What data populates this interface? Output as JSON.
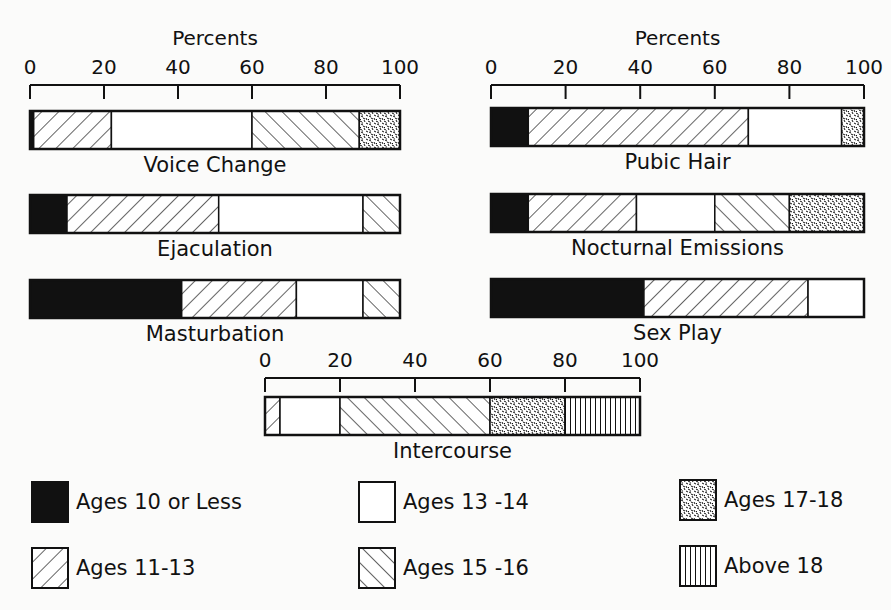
{
  "chart_data": {
    "type": "bar",
    "subtype": "stacked-horizontal-100-percent",
    "title": "",
    "xlabel": "Percents",
    "xlim": [
      0,
      100
    ],
    "x_ticks": [
      0,
      20,
      40,
      60,
      80,
      100
    ],
    "grid": false,
    "legend_position": "bottom",
    "series_names": [
      "Ages 10 or Less",
      "Ages 11-13",
      "Ages 13-14",
      "Ages 15-16",
      "Ages 17-18",
      "Above 18"
    ],
    "categories": [
      "Voice Change",
      "Ejaculation",
      "Masturbation",
      "Pubic Hair",
      "Nocturnal Emissions",
      "Sex Play",
      "Intercourse"
    ],
    "series": [
      {
        "name": "Ages 10 or Less",
        "pattern": "solid-black",
        "values": [
          1,
          10,
          41,
          10,
          10,
          41,
          0
        ]
      },
      {
        "name": "Ages 11-13",
        "pattern": "forward-hatch",
        "values": [
          21,
          41,
          31,
          59,
          29,
          44,
          4
        ]
      },
      {
        "name": "Ages 13-14",
        "pattern": "white",
        "values": [
          38,
          39,
          18,
          25,
          21,
          15,
          16
        ]
      },
      {
        "name": "Ages 15-16",
        "pattern": "back-hatch",
        "values": [
          29,
          10,
          10,
          0,
          20,
          0,
          40
        ]
      },
      {
        "name": "Ages 17-18",
        "pattern": "stipple",
        "values": [
          11,
          0,
          0,
          6,
          20,
          0,
          20
        ]
      },
      {
        "name": "Above 18",
        "pattern": "vertical-lines",
        "values": [
          0,
          0,
          0,
          0,
          0,
          0,
          20
        ]
      }
    ]
  },
  "panels": [
    {
      "axis_title": "Percents",
      "ticks": [
        "0",
        "20",
        "40",
        "60",
        "80",
        "100"
      ]
    },
    {
      "axis_title": "Percents",
      "ticks": [
        "0",
        "20",
        "40",
        "60",
        "80",
        "100"
      ]
    },
    {
      "axis_title": "",
      "ticks": [
        "0",
        "20",
        "40",
        "60",
        "80",
        "100"
      ]
    }
  ],
  "bars": [
    {
      "label": "Voice Change"
    },
    {
      "label": "Ejaculation"
    },
    {
      "label": "Masturbation"
    },
    {
      "label": "Pubic Hair"
    },
    {
      "label": "Nocturnal Emissions"
    },
    {
      "label": "Sex Play"
    },
    {
      "label": "Intercourse"
    }
  ],
  "legend": [
    {
      "label": "Ages 10 or Less"
    },
    {
      "label": "Ages 11-13"
    },
    {
      "label": "Ages 13 -14"
    },
    {
      "label": "Ages 15 -16"
    },
    {
      "label": "Ages 17-18"
    },
    {
      "label": "Above 18"
    }
  ]
}
